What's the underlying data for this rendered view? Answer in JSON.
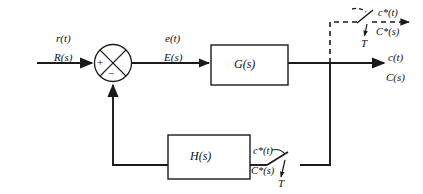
{
  "diagram": {
    "colors": {
      "line": "#1a1a1a",
      "text": "#101010",
      "background": "#ffffff"
    },
    "input": {
      "time_label": "r(t)",
      "laplace_label": "R(s)"
    },
    "summing_junction": {
      "plus_sign": "+",
      "minus_sign": "−"
    },
    "error": {
      "time_label": "e(t)",
      "laplace_label": "E(s)"
    },
    "forward_block": {
      "label": "G(s)"
    },
    "feedback_block": {
      "label": "H(s)"
    },
    "output": {
      "time_label": "c(t)",
      "laplace_label": "C(s)"
    },
    "top_sampler": {
      "time_label": "c*(t)",
      "laplace_label": "C*(s)",
      "period_label": "T"
    },
    "bottom_sampler": {
      "time_label": "c*(t)",
      "laplace_label": "C*(s)",
      "period_label": "T"
    }
  }
}
